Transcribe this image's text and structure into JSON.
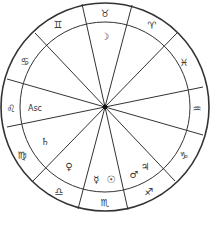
{
  "chart": {
    "type": "astrological-wheel",
    "center": [
      105,
      107
    ],
    "outer_radius": 104,
    "inner_radius": 85,
    "line_color": "#333333",
    "cusp_lines": [
      [
        82,
        4,
        128,
        210
      ],
      [
        132,
        5,
        78,
        209
      ],
      [
        177,
        33,
        33,
        181
      ],
      [
        203,
        87,
        7,
        127
      ],
      [
        203,
        135,
        7,
        79
      ],
      [
        35,
        33,
        175,
        181
      ]
    ]
  },
  "signs": [
    {
      "name": "taurus",
      "glyph": "♉",
      "x": 105,
      "y": 13
    },
    {
      "name": "aries",
      "glyph": "♈",
      "x": 152,
      "y": 25
    },
    {
      "name": "pisces",
      "glyph": "♓",
      "x": 184,
      "y": 62
    },
    {
      "name": "aquarius",
      "glyph": "♒",
      "x": 197,
      "y": 108
    },
    {
      "name": "capricorn",
      "glyph": "♑",
      "x": 184,
      "y": 155
    },
    {
      "name": "sagittarius",
      "glyph": "♐",
      "x": 149,
      "y": 191
    },
    {
      "name": "scorpio",
      "glyph": "♏",
      "x": 105,
      "y": 202
    },
    {
      "name": "libra",
      "glyph": "♎",
      "x": 59,
      "y": 191
    },
    {
      "name": "virgo",
      "glyph": "♍",
      "x": 22,
      "y": 155
    },
    {
      "name": "leo",
      "glyph": "♌",
      "x": 11,
      "y": 108
    },
    {
      "name": "cancer",
      "glyph": "♋",
      "x": 25,
      "y": 61
    },
    {
      "name": "gemini",
      "glyph": "♊",
      "x": 58,
      "y": 24
    }
  ],
  "bodies": [
    {
      "name": "moon",
      "glyph": "☽",
      "x": 105,
      "y": 36
    },
    {
      "name": "ascendant",
      "glyph": "Asc",
      "x": 35,
      "y": 108
    },
    {
      "name": "saturn",
      "glyph": "♄",
      "x": 45,
      "y": 141
    },
    {
      "name": "venus",
      "glyph": "♀",
      "x": 69,
      "y": 166
    },
    {
      "name": "mercury",
      "glyph": "☿",
      "x": 96,
      "y": 179
    },
    {
      "name": "sun",
      "glyph": "☉",
      "x": 111,
      "y": 179
    },
    {
      "name": "mars",
      "glyph": "♂",
      "x": 134,
      "y": 174
    },
    {
      "name": "jupiter",
      "glyph": "♃",
      "x": 145,
      "y": 166
    }
  ],
  "caption": ""
}
